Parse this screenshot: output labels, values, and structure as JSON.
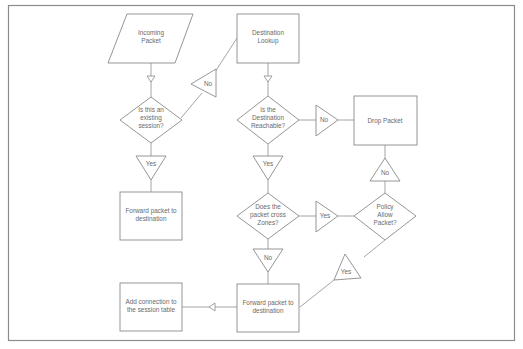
{
  "diagram": {
    "nodes": {
      "incoming_packet": {
        "type": "parallelogram",
        "lines": [
          "Incoming",
          "Packet"
        ]
      },
      "existing_session": {
        "type": "decision",
        "lines": [
          "Is this an",
          "existing",
          "session?"
        ]
      },
      "forward_existing": {
        "type": "process",
        "lines": [
          "Forward packet to",
          "destination"
        ]
      },
      "destination_lookup": {
        "type": "process",
        "lines": [
          "Destination",
          "Lookup"
        ]
      },
      "dest_reachable": {
        "type": "decision",
        "lines": [
          "Is the",
          "Destination",
          "Reachable?"
        ]
      },
      "drop_packet": {
        "type": "process",
        "lines": [
          "Drop Packet"
        ]
      },
      "cross_zones": {
        "type": "decision",
        "lines": [
          "Does the",
          "packet cross",
          "Zones?"
        ]
      },
      "policy_allow": {
        "type": "decision",
        "lines": [
          "Policy",
          "Allow",
          "Packet?"
        ]
      },
      "forward_new": {
        "type": "process",
        "lines": [
          "Forward packet to",
          "destination"
        ]
      },
      "add_connection": {
        "type": "process",
        "lines": [
          "Add connection to",
          "the session table"
        ]
      }
    },
    "edge_labels": {
      "session_no": "No",
      "session_yes": "Yes",
      "reachable_no": "No",
      "reachable_yes": "Yes",
      "cross_yes": "Yes",
      "cross_no": "No",
      "policy_no": "No",
      "policy_yes": "Yes"
    },
    "edges": [
      {
        "from": "incoming_packet",
        "to": "existing_session",
        "label": ""
      },
      {
        "from": "existing_session",
        "to": "destination_lookup",
        "label": "No"
      },
      {
        "from": "existing_session",
        "to": "forward_existing",
        "label": "Yes"
      },
      {
        "from": "destination_lookup",
        "to": "dest_reachable",
        "label": ""
      },
      {
        "from": "dest_reachable",
        "to": "drop_packet",
        "label": "No"
      },
      {
        "from": "dest_reachable",
        "to": "cross_zones",
        "label": "Yes"
      },
      {
        "from": "cross_zones",
        "to": "policy_allow",
        "label": "Yes"
      },
      {
        "from": "cross_zones",
        "to": "forward_new",
        "label": "No"
      },
      {
        "from": "policy_allow",
        "to": "drop_packet",
        "label": "No"
      },
      {
        "from": "policy_allow",
        "to": "forward_new",
        "label": "Yes"
      },
      {
        "from": "forward_new",
        "to": "add_connection",
        "label": ""
      }
    ],
    "colors": {
      "stroke": "#8a8a8a",
      "text": "#6a6a6a",
      "background": "#ffffff"
    }
  }
}
